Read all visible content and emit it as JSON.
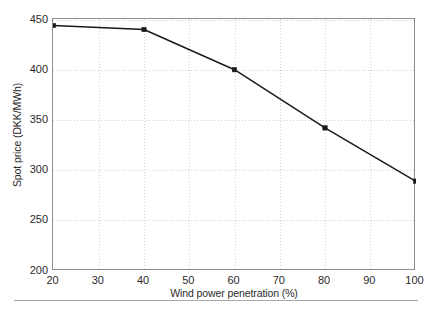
{
  "chart_data": {
    "type": "line",
    "title": "",
    "xlabel": "Wind power penetration (%)",
    "ylabel": "Spot price (DKK/MWh)",
    "x": [
      20,
      40,
      60,
      80,
      100
    ],
    "values": [
      444,
      440,
      400,
      342,
      289
    ],
    "series": [
      {
        "name": "Spot price",
        "x": [
          20,
          40,
          60,
          80,
          100
        ],
        "values": [
          444,
          440,
          400,
          342,
          289
        ]
      }
    ],
    "xlim": [
      20,
      100
    ],
    "ylim": [
      200,
      450
    ],
    "xticks": [
      20,
      30,
      40,
      50,
      60,
      70,
      80,
      90,
      100
    ],
    "yticks": [
      200,
      250,
      300,
      350,
      400,
      450
    ],
    "xtick_labels": [
      "20",
      "30",
      "40",
      "50",
      "60",
      "70",
      "80",
      "90",
      "100"
    ],
    "ytick_labels": [
      "200",
      "250",
      "300",
      "350",
      "400",
      "450"
    ],
    "grid": true,
    "grid_style": "dotted",
    "legend": false,
    "legend_position": "none",
    "marker": "square",
    "line_color": "#1a1a1a",
    "marker_color": "#1a1a1a",
    "grid_color": "#d0d0d0",
    "frame_color": "#8f8f8f",
    "background_color": "#ffffff"
  }
}
